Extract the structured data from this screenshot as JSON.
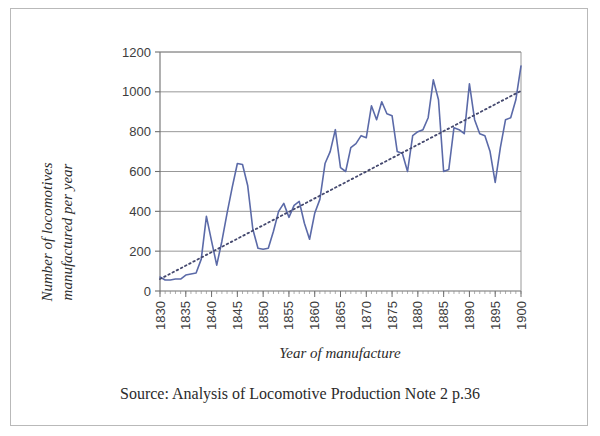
{
  "figure": {
    "source_note": "Source: Analysis of Locomotive Production Note 2 p.36",
    "frame_color": "#b9b9b9",
    "background_color": "#ffffff"
  },
  "chart_data": {
    "type": "line",
    "title": "",
    "subtitle": "",
    "xlabel": "Year of manufacture",
    "ylabel": "Number of locomotives manufactured per year",
    "ylabel_line1": "Number of locomotives",
    "ylabel_line2": "manufactured per year",
    "xlim": [
      1830,
      1900
    ],
    "ylim": [
      0,
      1200
    ],
    "yticks": [
      0,
      200,
      400,
      600,
      800,
      1000,
      1200
    ],
    "ytick_labels": [
      "0",
      "200",
      "400",
      "600",
      "800",
      "1000",
      "1200"
    ],
    "xticks": [
      1830,
      1835,
      1840,
      1845,
      1850,
      1855,
      1860,
      1865,
      1870,
      1875,
      1880,
      1885,
      1890,
      1895,
      1900
    ],
    "xtick_labels": [
      "1830",
      "1835",
      "1840",
      "1845",
      "1850",
      "1855",
      "1860",
      "1865",
      "1870",
      "1875",
      "1880",
      "1885",
      "1890",
      "1895",
      "1900"
    ],
    "xtick_rotation": -90,
    "xtick_minor_step": 1,
    "grid": {
      "horizontal": true,
      "vertical": false,
      "color": "#8c8c8c"
    },
    "legend": {
      "visible": false,
      "position": "none"
    },
    "series": [
      {
        "name": "Number of locomotives manufactured per year",
        "type": "line",
        "color": "#5b6aa8",
        "linewidth": 1.6,
        "linestyle": "solid",
        "x": [
          1830,
          1831,
          1832,
          1833,
          1834,
          1835,
          1836,
          1837,
          1838,
          1839,
          1840,
          1841,
          1842,
          1843,
          1844,
          1845,
          1846,
          1847,
          1848,
          1849,
          1850,
          1851,
          1852,
          1853,
          1854,
          1855,
          1856,
          1857,
          1858,
          1859,
          1860,
          1861,
          1862,
          1863,
          1864,
          1865,
          1866,
          1867,
          1868,
          1869,
          1870,
          1871,
          1872,
          1873,
          1874,
          1875,
          1876,
          1877,
          1878,
          1879,
          1880,
          1881,
          1882,
          1883,
          1884,
          1885,
          1886,
          1887,
          1888,
          1889,
          1890,
          1891,
          1892,
          1893,
          1894,
          1895,
          1896,
          1897,
          1898,
          1899,
          1900
        ],
        "values": [
          70,
          55,
          55,
          60,
          60,
          80,
          85,
          90,
          160,
          375,
          250,
          130,
          250,
          390,
          520,
          640,
          635,
          530,
          310,
          215,
          210,
          215,
          300,
          400,
          440,
          370,
          430,
          450,
          340,
          260,
          390,
          460,
          640,
          700,
          810,
          620,
          600,
          720,
          740,
          780,
          770,
          930,
          860,
          950,
          890,
          880,
          700,
          690,
          600,
          780,
          800,
          810,
          870,
          1060,
          960,
          600,
          610,
          820,
          810,
          790,
          1040,
          860,
          790,
          780,
          700,
          545,
          720,
          860,
          870,
          960,
          1130
        ]
      },
      {
        "name": "Trend line",
        "type": "line",
        "color": "#44486e",
        "linewidth": 1.8,
        "linestyle": "dotted",
        "x": [
          1830,
          1900
        ],
        "values": [
          60,
          1005
        ]
      }
    ]
  }
}
